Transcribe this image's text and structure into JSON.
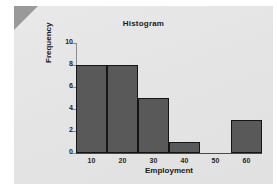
{
  "slide": {
    "background_color": "#ffffff",
    "card_color": "#e6e6e6",
    "corner_fold_color": "#9a9a9a"
  },
  "chart_data": {
    "type": "bar",
    "title": "Histogram",
    "xlabel": "Employment",
    "ylabel": "Frequency",
    "categories": [
      "10",
      "20",
      "30",
      "40",
      "50",
      "60"
    ],
    "values": [
      8,
      8,
      5,
      1,
      0,
      3
    ],
    "bin_edges": [
      5,
      15,
      25,
      35,
      45,
      55,
      65
    ],
    "xlim": [
      5,
      65
    ],
    "ylim": [
      0,
      10
    ],
    "xticks": [
      "10",
      "20",
      "30",
      "40",
      "50",
      "60"
    ],
    "yticks": [
      "0",
      "2",
      "4",
      "6",
      "8",
      "10"
    ],
    "ytick_values": [
      0,
      2,
      4,
      6,
      8,
      10
    ],
    "xtick_values": [
      10,
      20,
      30,
      40,
      50,
      60
    ],
    "grid": false,
    "legend": null,
    "bar_fill_color": "#595959",
    "bar_edge_color": "#151515",
    "axis_color": "#8c8c8c"
  }
}
